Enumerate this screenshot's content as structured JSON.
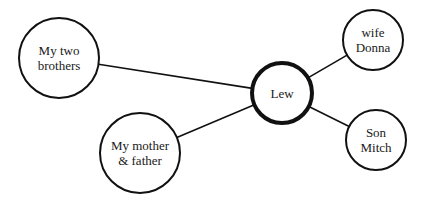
{
  "diagram": {
    "type": "ego-network",
    "center": {
      "id": "lew",
      "lines": [
        "Lew"
      ],
      "cx": 282,
      "cy": 93,
      "r": 30,
      "stroke_width": 4
    },
    "nodes": [
      {
        "id": "brothers",
        "lines": [
          "My two",
          "brothers"
        ],
        "cx": 59,
        "cy": 58,
        "r": 40,
        "stroke_width": 2
      },
      {
        "id": "donna",
        "lines": [
          "wife",
          "Donna"
        ],
        "cx": 373,
        "cy": 40,
        "r": 30,
        "stroke_width": 2
      },
      {
        "id": "parents",
        "lines": [
          "My mother",
          "& father"
        ],
        "cx": 140,
        "cy": 153,
        "r": 40,
        "stroke_width": 2
      },
      {
        "id": "mitch",
        "lines": [
          "Son",
          "Mitch"
        ],
        "cx": 376,
        "cy": 140,
        "r": 30,
        "stroke_width": 2
      }
    ],
    "edges": [
      {
        "from": "brothers",
        "to": "lew"
      },
      {
        "from": "parents",
        "to": "lew"
      },
      {
        "from": "donna",
        "to": "lew"
      },
      {
        "from": "mitch",
        "to": "lew"
      }
    ],
    "colors": {
      "stroke": "#111111",
      "fill": "#ffffff",
      "text": "#1a1a1a"
    }
  }
}
